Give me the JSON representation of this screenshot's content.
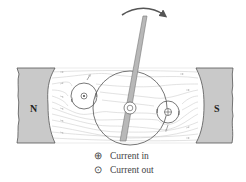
{
  "diagram": {
    "colors": {
      "magnet_fill": "#c9c9c9",
      "magnet_stroke": "#555555",
      "field_line": "#cfcfcf",
      "outline": "#666666",
      "needle_fill": "#b8b8b8",
      "arrow": "#555555"
    },
    "poles": {
      "left": "N",
      "right": "S"
    },
    "conductors": [
      {
        "id": "left-coil-side",
        "symbol": "dot",
        "meaning": "Current out"
      },
      {
        "id": "right-coil-side",
        "symbol": "cross",
        "meaning": "Current in"
      }
    ],
    "rotation_arrow": "clockwise"
  },
  "legend": {
    "items": [
      {
        "symbol": "⊕",
        "label": "Current in"
      },
      {
        "symbol": "⊙",
        "label": "Current out"
      }
    ]
  }
}
